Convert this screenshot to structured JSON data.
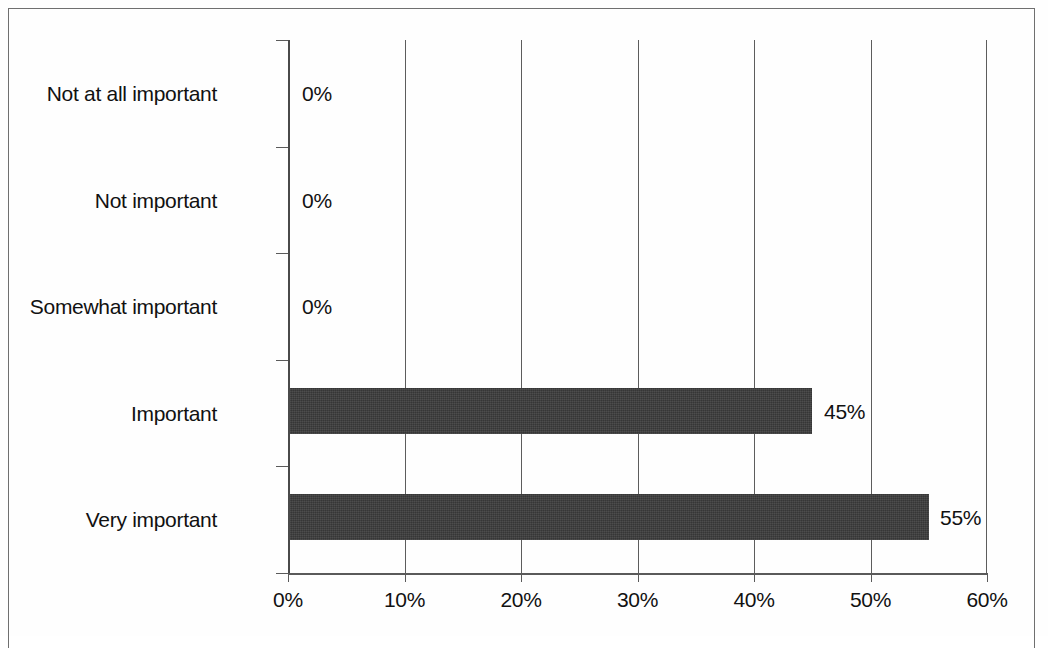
{
  "chart_data": {
    "type": "bar",
    "orientation": "horizontal",
    "title": "",
    "subtitle": "",
    "xlabel": "",
    "ylabel": "",
    "categories": [
      "Not at all important",
      "Not important",
      "Somewhat important",
      "Important",
      "Very important"
    ],
    "values": [
      0,
      0,
      0,
      45,
      55
    ],
    "value_labels": [
      "0%",
      "0%",
      "0%",
      "45%",
      "55%"
    ],
    "xlim": [
      0,
      60
    ],
    "xticks": [
      0,
      10,
      20,
      30,
      40,
      50,
      60
    ],
    "xtick_labels": [
      "0%",
      "10%",
      "20%",
      "30%",
      "40%",
      "50%",
      "60%"
    ],
    "grid": true,
    "grid_axis": "x",
    "legend": false,
    "bar_color": "#3b3b3b",
    "axis_color": "#5a5a5a",
    "background_color": "#ffffff"
  },
  "axis": {
    "tick_labels": [
      "0%",
      "10%",
      "20%",
      "30%",
      "40%",
      "50%",
      "60%"
    ]
  },
  "bars": [
    {
      "label": "Not at all important",
      "value": 0,
      "value_label": "0%"
    },
    {
      "label": "Not important",
      "value": 0,
      "value_label": "0%"
    },
    {
      "label": "Somewhat important",
      "value": 0,
      "value_label": "0%"
    },
    {
      "label": "Important",
      "value": 45,
      "value_label": "45%"
    },
    {
      "label": "Very important",
      "value": 55,
      "value_label": "55%"
    }
  ]
}
